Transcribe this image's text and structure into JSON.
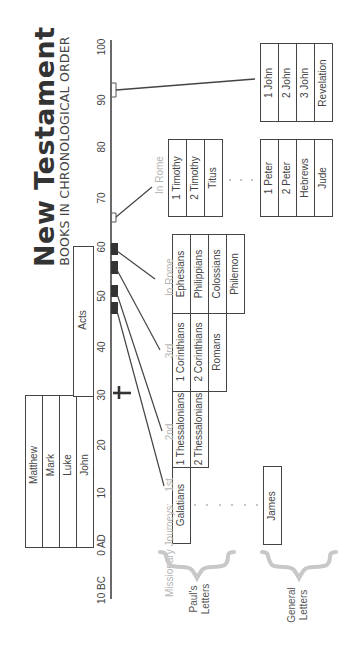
{
  "header": {
    "title": "New Testament",
    "subtitle": "BOOKS IN CHRONOLOGICAL ORDER"
  },
  "timeline": {
    "ticks": [
      "100",
      "90",
      "80",
      "70",
      "60",
      "50",
      "40",
      "30",
      "20",
      "10",
      "0 AD",
      "10 BC"
    ]
  },
  "gospels": [
    "Matthew",
    "Mark",
    "Luke",
    "John"
  ],
  "acts": "Acts",
  "journeys": {
    "prefix": "Missionary Journeys:",
    "first": "1st",
    "second": "2nd",
    "third": "3rd",
    "rome1": "In Rome",
    "rome2": "In Rome"
  },
  "pauls_letters": {
    "group1": [
      "Galatians"
    ],
    "group2": [
      "1 Thessalonians",
      "2 Thessalonians"
    ],
    "group3": [
      "1 Corinthians",
      "2 Corinthians",
      "Romans"
    ],
    "group4": [
      "Ephesians",
      "Philippians",
      "Colossians",
      "Philemon"
    ],
    "group5": [
      "1 Timothy",
      "2 Timothy",
      "Titus"
    ],
    "label_line1": "Paul's",
    "label_line2": "Letters"
  },
  "general_letters": {
    "group1": [
      "James"
    ],
    "group2": [
      "1 Peter",
      "2 Peter",
      "Hebrews",
      "Jude"
    ],
    "group3": [
      "1 John",
      "2 John",
      "3 John",
      "Revelation"
    ],
    "label_line1": "General",
    "label_line2": "Letters"
  },
  "colors": {
    "ink": "#444444",
    "muted": "#b5b5b5",
    "brace": "#c8c8c8"
  }
}
